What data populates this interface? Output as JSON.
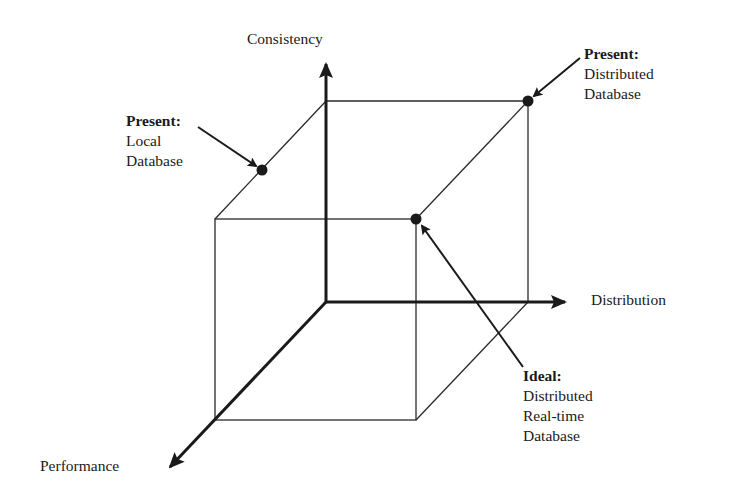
{
  "diagram": {
    "axes": {
      "consistency": "Consistency",
      "distribution": "Distribution",
      "performance": "Performance"
    },
    "points": [
      {
        "id": "present-local",
        "heading": "Present:",
        "lines": [
          "Local",
          "Database"
        ]
      },
      {
        "id": "present-distributed",
        "heading": "Present:",
        "lines": [
          "Distributed",
          "Database"
        ]
      },
      {
        "id": "ideal",
        "heading": "Ideal:",
        "lines": [
          "Distributed",
          "Real-time",
          "Database"
        ]
      }
    ],
    "colors": {
      "line": "#1a1a1a",
      "background": "#ffffff"
    }
  }
}
